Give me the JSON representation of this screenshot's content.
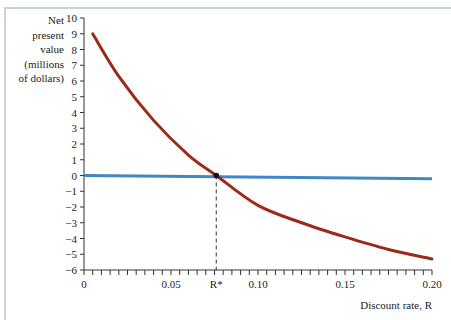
{
  "chart_data": {
    "type": "line",
    "title": "",
    "xlabel": "Discount rate, R",
    "ylabel_lines": [
      "Net",
      "present",
      "value",
      "(millions",
      "of dollars)"
    ],
    "ylabel": "Net present value (millions of dollars)",
    "xlim": [
      0,
      0.2
    ],
    "ylim": [
      -6,
      10
    ],
    "x_ticks": [
      "0",
      "0.05",
      "R*",
      "0.10",
      "0.15",
      "0.20"
    ],
    "y_ticks": [
      "10",
      "9",
      "8",
      "7",
      "6",
      "5",
      "4",
      "3",
      "2",
      "1",
      "0",
      "-1",
      "-2",
      "-3",
      "-4",
      "-5",
      "-6"
    ],
    "grid": false,
    "legend": "none",
    "annotations": [
      {
        "text": "R*",
        "x": 0.076,
        "y": 0,
        "style": "dashed vertical line to x-axis with point marker"
      }
    ],
    "series": [
      {
        "name": "NPV curve",
        "color": "#9b2a17",
        "x": [
          0.005,
          0.02,
          0.04,
          0.06,
          0.076,
          0.1,
          0.125,
          0.15,
          0.175,
          0.2
        ],
        "values": [
          9.0,
          6.3,
          3.5,
          1.3,
          0.0,
          -1.9,
          -3.0,
          -3.9,
          -4.7,
          -5.3
        ]
      },
      {
        "name": "Zero line",
        "color": "#3f88c5",
        "x": [
          0,
          0.2
        ],
        "values": [
          0.0,
          -0.2
        ]
      }
    ]
  },
  "labels": {
    "y_title": [
      "Net",
      "present",
      "value",
      "(millions",
      "of dollars)"
    ],
    "x_title": "Discount rate, R",
    "x_ticks": [
      {
        "label": "0",
        "value": 0
      },
      {
        "label": "0.05",
        "value": 0.05
      },
      {
        "label": "R*",
        "value": 0.076
      },
      {
        "label": "0.10",
        "value": 0.1
      },
      {
        "label": "0.15",
        "value": 0.15
      },
      {
        "label": "0.20",
        "value": 0.2
      }
    ]
  }
}
